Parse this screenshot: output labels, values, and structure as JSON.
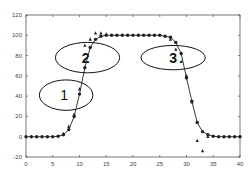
{
  "chart_data": {
    "type": "scatter",
    "title": "",
    "xlabel": "",
    "ylabel": "",
    "xlim": [
      0,
      40
    ],
    "ylim": [
      -20,
      120
    ],
    "grid": false,
    "x_ticks": [
      0,
      5,
      10,
      15,
      20,
      25,
      30,
      35,
      40
    ],
    "y_ticks": [
      -20,
      0,
      20,
      40,
      60,
      80,
      100,
      120
    ],
    "series": [
      {
        "name": "circles (fitted curve)",
        "marker": "circle",
        "line": true,
        "x": [
          0,
          1,
          2,
          3,
          4,
          5,
          6,
          7,
          8,
          9,
          10,
          11,
          12,
          13,
          14,
          15,
          16,
          17,
          18,
          19,
          20,
          21,
          22,
          23,
          24,
          25,
          26,
          27,
          28,
          29,
          30,
          31,
          32,
          33,
          34,
          35,
          36,
          37,
          38,
          39,
          40
        ],
        "y": [
          0,
          0,
          0,
          0,
          0,
          0,
          0.5,
          2,
          7,
          20,
          42,
          68,
          88,
          96,
          99,
          100,
          100,
          100,
          100,
          100,
          100,
          100,
          100,
          100,
          100,
          100,
          99,
          98,
          93,
          82,
          58,
          35,
          14,
          5,
          2,
          0.5,
          0,
          0,
          0,
          0,
          0
        ]
      },
      {
        "name": "triangles",
        "marker": "triangle",
        "line": false,
        "x": [
          7,
          8,
          9,
          10,
          11,
          12,
          13,
          14,
          15,
          27,
          28,
          29,
          30,
          31,
          32,
          33,
          34
        ],
        "y": [
          3,
          10,
          22,
          47,
          90,
          96,
          102,
          102,
          101,
          96,
          86,
          74,
          60,
          34,
          -4,
          -14,
          0
        ]
      }
    ],
    "annotations": [
      {
        "label": "1",
        "shape": "ellipse",
        "cx": 7.5,
        "cy": 41,
        "rx": 5,
        "ry": 15
      },
      {
        "label": "2",
        "shape": "ellipse",
        "cx": 11.5,
        "cy": 78,
        "rx": 6,
        "ry": 15
      },
      {
        "label": "3",
        "shape": "ellipse",
        "cx": 27.5,
        "cy": 78,
        "rx": 6,
        "ry": 12
      }
    ]
  }
}
